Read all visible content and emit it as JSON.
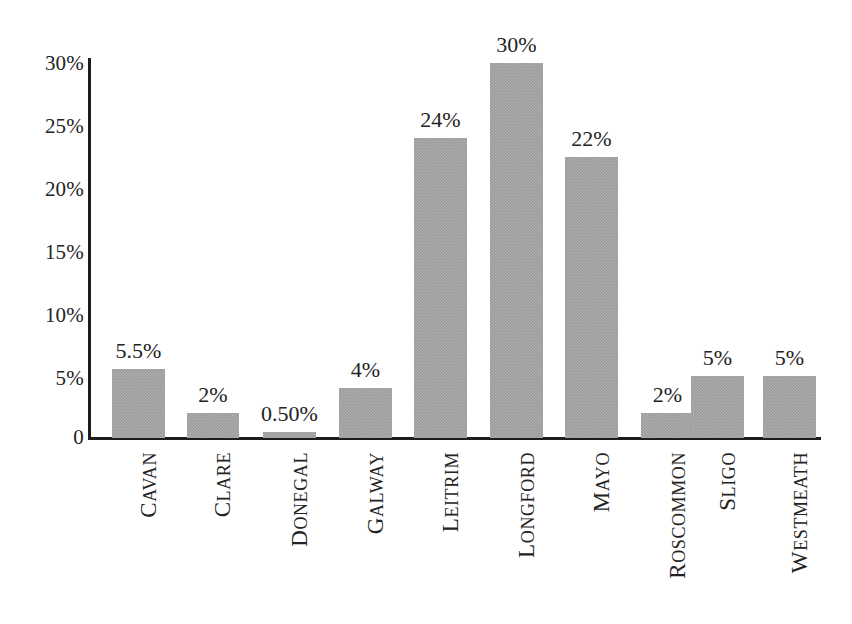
{
  "chart_data": {
    "type": "bar",
    "title": "",
    "subtitle": "",
    "xlabel": "",
    "ylabel": "",
    "categories": [
      "CAVAN",
      "CLARE",
      "DONEGAL",
      "GALWAY",
      "LEITRIM",
      "LONGFORD",
      "MAYO",
      "ROSCOMMON",
      "SLIGO",
      "WESTMEATH"
    ],
    "values": [
      5.5,
      2,
      0.5,
      4,
      24,
      30,
      22,
      2,
      5,
      5
    ],
    "data_labels": [
      "5.5%",
      "2%",
      "0.50%",
      "4%",
      "24%",
      "30%",
      "22%",
      "2%",
      "5%",
      "5%"
    ],
    "ylim": [
      0,
      30
    ],
    "ytick_values": [
      0,
      5,
      10,
      15,
      20,
      25,
      30
    ],
    "ytick_labels": [
      "0",
      "5%",
      "10%",
      "15%",
      "20%",
      "25%",
      "30%"
    ],
    "grid": false,
    "legend": false,
    "legend_position": "none",
    "series": [
      {
        "name": "",
        "values": [
          5.5,
          2,
          0.5,
          4,
          24,
          30,
          22,
          2,
          5,
          5
        ]
      }
    ],
    "bar_color": "#9a9a9a",
    "axis_color": "#1d1d1d",
    "text_color": "#232323",
    "background_color": "#ffffff"
  }
}
